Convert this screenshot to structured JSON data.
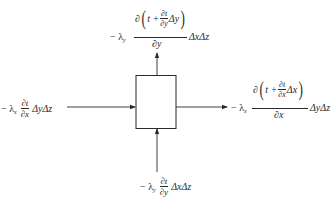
{
  "diagram": {
    "type": "control-volume heat flux diagram",
    "colors": {
      "ink": "#2a2a2a",
      "background": "#ffffff"
    },
    "box": {
      "x": 136,
      "y": 75,
      "width": 40,
      "height": 54
    },
    "arrows": [
      {
        "id": "left-in",
        "from": [
          67,
          107
        ],
        "to": [
          135,
          107
        ],
        "direction": "right"
      },
      {
        "id": "right-out",
        "from": [
          176,
          107
        ],
        "to": [
          227,
          107
        ],
        "direction": "right"
      },
      {
        "id": "top-out",
        "from": [
          157,
          75
        ],
        "to": [
          157,
          53
        ],
        "direction": "up"
      },
      {
        "id": "bottom-in",
        "from": [
          157,
          172
        ],
        "to": [
          157,
          129
        ],
        "direction": "up"
      }
    ],
    "labels": {
      "left": {
        "coef": "− λ",
        "coef_sub": "x",
        "num": "∂t",
        "den": "∂x",
        "tail": "ΔyΔz"
      },
      "bottom": {
        "coef": "− λ",
        "coef_sub": "y",
        "num": "∂t",
        "den": "∂y",
        "tail": "ΔxΔz"
      },
      "top": {
        "coef": "− λ",
        "coef_sub": "y",
        "num_prefix": "∂",
        "num_paren_open": "(",
        "num_t": "t +",
        "num_inner_num": "∂t",
        "num_inner_den": "∂y",
        "num_inner_tail": "Δy",
        "num_paren_close": ")",
        "den": "∂y",
        "tail": "ΔxΔz"
      },
      "right": {
        "coef": "− λ",
        "coef_sub": "x",
        "num_prefix": "∂",
        "num_paren_open": "(",
        "num_t": "t +",
        "num_inner_num": "∂t",
        "num_inner_den": "∂x",
        "num_inner_tail": "Δx",
        "num_paren_close": ")",
        "den": "∂x",
        "tail": "ΔyΔz"
      }
    }
  }
}
